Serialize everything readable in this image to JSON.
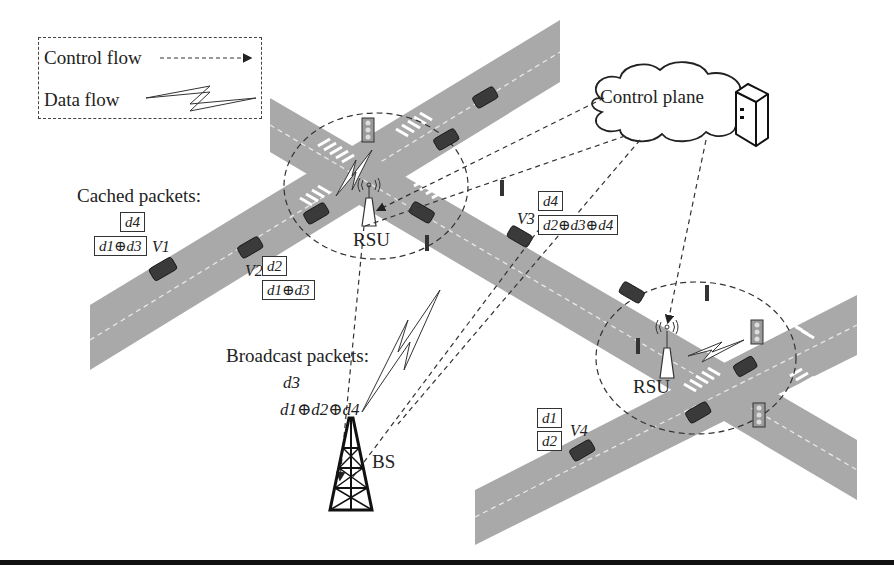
{
  "legend": {
    "control_flow_label": "Control flow",
    "data_flow_label": "Data flow"
  },
  "cached": {
    "title": "Cached packets:",
    "v1": {
      "label": "V1",
      "packets": [
        "d4",
        "d1⊕d3"
      ]
    },
    "v2": {
      "label": "V2",
      "packets": [
        "d2",
        "d1⊕d3"
      ]
    },
    "v3": {
      "label": "V3",
      "packets": [
        "d4",
        "d2⊕d3⊕d4"
      ]
    },
    "v4": {
      "label": "V4",
      "packets": [
        "d1",
        "d2"
      ]
    }
  },
  "broadcast": {
    "title": "Broadcast packets:",
    "packets": [
      "d3",
      "d1⊕d2⊕d4"
    ]
  },
  "nodes": {
    "control_plane": "Control plane",
    "rsu_1": "RSU",
    "rsu_2": "RSU",
    "bs": "BS"
  },
  "colors": {
    "road": "#a9a9a9",
    "car": "#3a3a3a",
    "line": "#333333",
    "background": "#ffffff"
  }
}
